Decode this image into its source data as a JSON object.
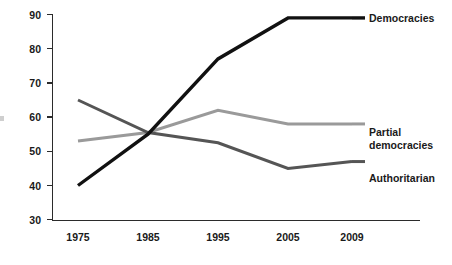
{
  "chart_data": {
    "type": "line",
    "title": "",
    "subtitle": "",
    "xlabel": "",
    "ylabel": "",
    "x": [
      "1975",
      "1985",
      "1995",
      "2005",
      "2009"
    ],
    "categories": [
      "1975",
      "1985",
      "1995",
      "2005",
      "2009"
    ],
    "xlim": [
      1975,
      2009
    ],
    "ylim": [
      30,
      90
    ],
    "y_ticks": [
      30,
      40,
      50,
      60,
      70,
      80,
      90
    ],
    "x_ticks": [
      "1975",
      "1985",
      "1995",
      "2005",
      "2009"
    ],
    "grid": false,
    "legend_position": "right-inline-end-of-line",
    "series": [
      {
        "name": "Democracies",
        "color": "#111111",
        "stroke_width": 3.4,
        "values": [
          40,
          55,
          77,
          89,
          89
        ]
      },
      {
        "name": "Partial democracies",
        "color": "#9a9a9a",
        "stroke_width": 3.0,
        "values": [
          53,
          55.5,
          62,
          58,
          58
        ]
      },
      {
        "name": "Authoritarian",
        "color": "#555555",
        "stroke_width": 3.0,
        "values": [
          65,
          55.5,
          52.5,
          45,
          47
        ]
      }
    ]
  },
  "labels": {
    "democracies": "Democracies",
    "partial_democracies_line1": "Partial",
    "partial_democracies_line2": "democracies",
    "authoritarian": "Authoritarian"
  },
  "axis": {
    "y_tick_90": "90",
    "y_tick_80": "80",
    "y_tick_70": "70",
    "y_tick_60": "60",
    "y_tick_50": "50",
    "y_tick_40": "40",
    "y_tick_30": "30",
    "x_tick_1975": "1975",
    "x_tick_1985": "1985",
    "x_tick_1995": "1995",
    "x_tick_2005": "2005",
    "x_tick_2009": "2009"
  },
  "colors": {
    "democracies": "#111111",
    "partial_democracies": "#9a9a9a",
    "authoritarian": "#555555",
    "axis": "#2b2b2b",
    "background": "#ffffff"
  }
}
